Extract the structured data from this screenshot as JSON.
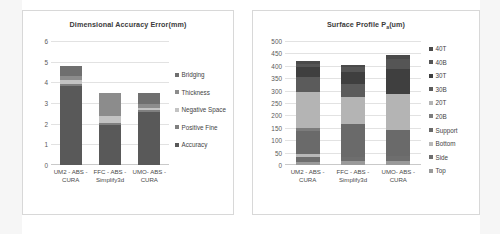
{
  "page": {
    "background": "#ffffff"
  },
  "charts": [
    {
      "id": "dimensional-accuracy-error",
      "title_main": "Dimensional Accuracy Error(mm)",
      "title_sub": "",
      "title_tail": ""
    },
    {
      "id": "surface-profile",
      "title_main": "Surface Profile P",
      "title_sub": "a",
      "title_tail": "(um)"
    }
  ],
  "chart_data": [
    {
      "type": "bar",
      "subtype": "stacked-column",
      "title": "Dimensional Accuracy Error(mm)",
      "xlabel": "",
      "ylabel": "",
      "ylim": [
        0,
        6
      ],
      "yticks": [
        0,
        1,
        2,
        3,
        4,
        5,
        6
      ],
      "ytick_labels": [
        "0",
        "1",
        "2",
        "3",
        "4",
        "5",
        "6"
      ],
      "grid": true,
      "legend_position": "right",
      "categories": [
        "UM2 - ABS - CURA",
        "FFC - ABS - Simplify3d",
        "UMO- ABS - CURA"
      ],
      "category_lines": [
        [
          "UM2 - ABS -",
          "CURA"
        ],
        [
          "FFC - ABS -",
          "Simplify3d"
        ],
        [
          "UMO- ABS -",
          "CURA"
        ]
      ],
      "series": [
        {
          "name": "Accuracy",
          "color": "#595959",
          "values": [
            3.8,
            1.95,
            2.58
          ]
        },
        {
          "name": "Positive Fine",
          "color": "#808080",
          "values": [
            0.1,
            0.08,
            0.08
          ]
        },
        {
          "name": "Negative Space",
          "color": "#c3c3c3",
          "values": [
            0.22,
            0.35,
            0.12
          ]
        },
        {
          "name": "Thickness",
          "color": "#8c8c8c",
          "values": [
            0.2,
            1.12,
            0.17
          ]
        },
        {
          "name": "Bridging",
          "color": "#6f6f6f",
          "values": [
            0.48,
            0.0,
            0.55
          ]
        }
      ],
      "totals": [
        4.8,
        3.5,
        3.5
      ]
    },
    {
      "type": "bar",
      "subtype": "stacked-column",
      "title": "Surface Profile Pa(um)",
      "xlabel": "",
      "ylabel": "",
      "ylim": [
        0,
        500
      ],
      "yticks": [
        0,
        50,
        100,
        150,
        200,
        250,
        300,
        350,
        400,
        450,
        500
      ],
      "ytick_labels": [
        "0",
        "50",
        "100",
        "150",
        "200",
        "250",
        "300",
        "350",
        "400",
        "450",
        "500"
      ],
      "grid": true,
      "legend_position": "right",
      "categories": [
        "UM2 - ABS - CURA",
        "FFC - ABS - Simplify3d",
        "UMO- ABS - CURA"
      ],
      "category_lines": [
        [
          "UM2 - ABS -",
          "CURA"
        ],
        [
          "FFC - ABS -",
          "Simplify3d"
        ],
        [
          "UMO- ABS -",
          "CURA"
        ]
      ],
      "series": [
        {
          "name": "Top",
          "color": "#9a9a9a",
          "values": [
            14,
            18,
            16
          ]
        },
        {
          "name": "Side",
          "color": "#6e6e6e",
          "values": [
            20,
            14,
            22
          ]
        },
        {
          "name": "Bottom",
          "color": "#b8b8b8",
          "values": [
            10,
            0,
            0
          ]
        },
        {
          "name": "Support",
          "color": "#6a6a6a",
          "values": [
            94,
            132,
            102
          ]
        },
        {
          "name": "20B",
          "color": "#7c7c7c",
          "values": [
            10,
            0,
            0
          ]
        },
        {
          "name": "20T",
          "color": "#b4b4b4",
          "values": [
            148,
            110,
            148
          ]
        },
        {
          "name": "30B",
          "color": "#5b5b5b",
          "values": [
            58,
            52,
            0
          ]
        },
        {
          "name": "30T",
          "color": "#3f3f3f",
          "values": [
            40,
            48,
            100
          ]
        },
        {
          "name": "40B",
          "color": "#555555",
          "values": [
            12,
            20,
            40
          ]
        },
        {
          "name": "40T",
          "color": "#4a4a4a",
          "values": [
            14,
            10,
            16
          ]
        }
      ],
      "totals": [
        420,
        404,
        444
      ]
    }
  ]
}
